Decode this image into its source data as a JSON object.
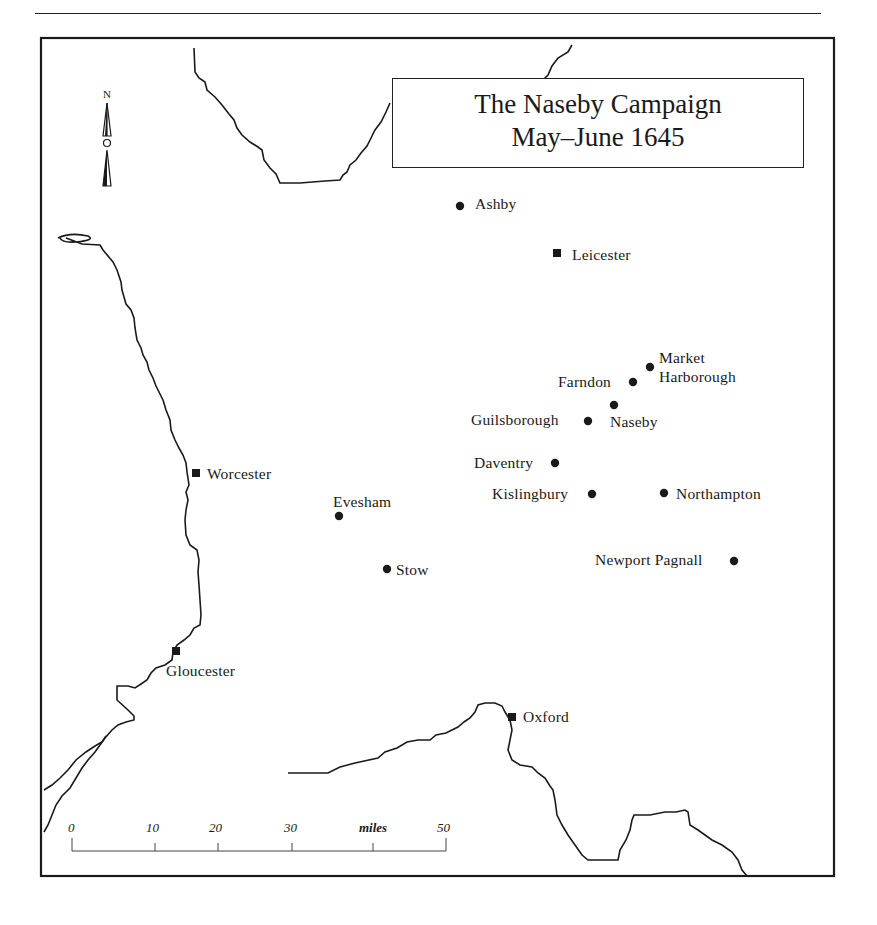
{
  "map": {
    "title_line1": "The Naseby Campaign",
    "title_line2": "May–June 1645",
    "north_label": "N",
    "legend": {
      "square_marker": "town (square marker)",
      "circle_marker": "place (circle marker)"
    },
    "places": [
      {
        "id": "ashby",
        "name": "Ashby",
        "marker": "circle"
      },
      {
        "id": "leicester",
        "name": "Leicester",
        "marker": "square"
      },
      {
        "id": "market-harborough",
        "name_line1": "Market",
        "name_line2": "Harborough",
        "marker": "circle"
      },
      {
        "id": "farndon",
        "name": "Farndon",
        "marker": "circle"
      },
      {
        "id": "naseby",
        "name": "Naseby",
        "marker": "circle"
      },
      {
        "id": "guilsborough",
        "name": "Guilsborough",
        "marker": "circle"
      },
      {
        "id": "daventry",
        "name": "Daventry",
        "marker": "circle"
      },
      {
        "id": "kislingbury",
        "name": "Kislingbury",
        "marker": "circle"
      },
      {
        "id": "northampton",
        "name": "Northampton",
        "marker": "circle"
      },
      {
        "id": "newport-pagnall",
        "name": "Newport Pagnall",
        "marker": "circle"
      },
      {
        "id": "worcester",
        "name": "Worcester",
        "marker": "square"
      },
      {
        "id": "evesham",
        "name": "Evesham",
        "marker": "circle"
      },
      {
        "id": "stow",
        "name": "Stow",
        "marker": "circle"
      },
      {
        "id": "gloucester",
        "name": "Gloucester",
        "marker": "square"
      },
      {
        "id": "oxford",
        "name": "Oxford",
        "marker": "square"
      }
    ],
    "scale_bar": {
      "ticks": [
        "0",
        "10",
        "20",
        "30",
        "miles",
        "50"
      ],
      "unit": "miles",
      "max_miles": 50
    },
    "colors": {
      "ink": "#1a1a1a",
      "paper": "#ffffff"
    }
  }
}
